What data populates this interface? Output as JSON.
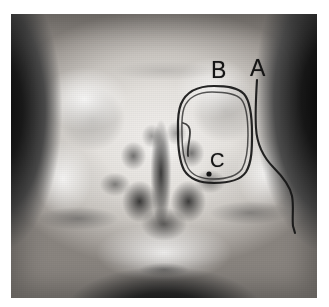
{
  "figure": {
    "kind": "annotated-radiograph",
    "modality": "plain-film-radiograph",
    "view": "waters-occipitomental-paranasal-sinuses",
    "alt": "Frontal plain radiograph of the facial skeleton and paranasal sinuses with hand-drawn ink annotations labelled A, B and C.",
    "plate": {
      "x": 11,
      "y": 14,
      "width": 306,
      "height": 284,
      "border_color": "#ffffff",
      "background_color": "#9a9a9a"
    }
  },
  "annotations": {
    "ink_color": "#141414",
    "items": [
      {
        "id": "a",
        "label": "A",
        "label_x": 250,
        "label_y": 57,
        "font_size": 23,
        "marker": "leader-line",
        "description": "Long hand-drawn leader line running inferiorly from the letter A, curving laterally to trace the right facial soft-tissue and lateral antral wall contour.",
        "path": "M 257 80 C 256 96, 255 112, 256 128 C 257 146, 264 158, 274 168 C 284 178, 290 186, 292 196 C 294 206, 292 216, 293 226 L 295 233"
      },
      {
        "id": "b",
        "label": "B",
        "label_x": 211,
        "label_y": 59,
        "font_size": 23,
        "marker": "encircling-outline",
        "description": "Hand-drawn rounded outline encircling the right maxillary sinus (antrum); the stroke is doubled where it was traced twice.",
        "path_outer": "M 214 86 C 198 86, 186 92, 181 104 C 177 114, 178 124, 178 133 C 178 146, 179 160, 184 170 C 190 180, 202 183, 214 183 C 228 183, 240 181, 246 172 C 252 162, 252 148, 252 134 C 252 118, 251 102, 244 94 C 237 87, 226 86, 214 86 Z",
        "path_inner": "M 212 92 C 199 92, 188 97, 184 108 C 181 117, 182 126, 182 135 C 182 147, 183 159, 188 168 C 193 177, 203 179, 214 179 C 226 179, 236 177, 242 169 C 247 160, 248 147, 248 135 C 248 120, 247 106, 241 99 C 235 93, 223 92, 212 92 Z",
        "path_notch": "M 183 123 C 187 124, 190 127, 190 132 C 190 140, 187 148, 188 156"
      },
      {
        "id": "c",
        "label": "C",
        "label_x": 210,
        "label_y": 150,
        "font_size": 20,
        "marker": "dot-pointer",
        "description": "Letter C with a small solid ink dot marking a point on the inferior/medial wall of the encircled right maxillary sinus.",
        "dot_x": 209,
        "dot_y": 174,
        "dot_radius": 2.6
      }
    ]
  }
}
